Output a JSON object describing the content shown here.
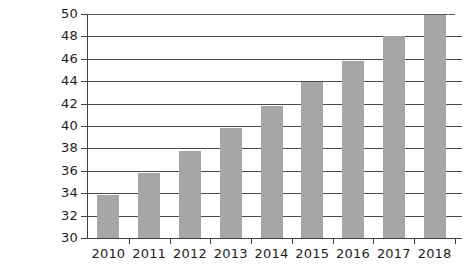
{
  "chart_data": {
    "type": "bar",
    "title": "",
    "subtitle": "",
    "xlabel": "",
    "ylabel": "",
    "categories": [
      "2010",
      "2011",
      "2012",
      "2013",
      "2014",
      "2015",
      "2016",
      "2017",
      "2018"
    ],
    "values": [
      33.8,
      35.8,
      37.8,
      39.8,
      41.8,
      43.9,
      45.8,
      48.0,
      49.9
    ],
    "series": [
      {
        "name": "",
        "values": [
          33.8,
          35.8,
          37.8,
          39.8,
          41.8,
          43.9,
          45.8,
          48.0,
          49.9
        ]
      }
    ],
    "ylim": [
      30,
      50
    ],
    "ytick_values": [
      30,
      32,
      34,
      36,
      38,
      40,
      42,
      44,
      46,
      48,
      50
    ],
    "ytick_labels": [
      "30",
      "32",
      "34",
      "36",
      "38",
      "40",
      "42",
      "44",
      "46",
      "48",
      "50"
    ],
    "xtick_labels": [
      "2010",
      "2011",
      "2012",
      "2013",
      "2014",
      "2015",
      "2016",
      "2017",
      "2018"
    ],
    "grid": "horizontal",
    "legend": "none",
    "legend_entries": [],
    "annotations": [],
    "bar_color": "#a6a6a6",
    "axis_color": "#3f3f3f",
    "gridline_color": "#4a4a4a",
    "background_color": "#ffffff",
    "text_color": "#1d1d1d"
  }
}
